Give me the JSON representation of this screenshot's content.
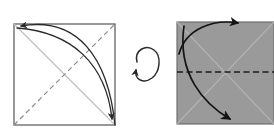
{
  "figure": {
    "type": "origami-fold-diagram",
    "title": "",
    "background_color": "#ffffff",
    "panels": [
      {
        "id": "panel-left",
        "name": "white-side-square",
        "label": "",
        "square": {
          "x": 14,
          "y": 24,
          "width": 101,
          "height": 101
        },
        "fill_color": "#ffffff",
        "border_color": "#555555",
        "border_width": 1.2,
        "creases": [
          {
            "name": "valley-crease-diagonal",
            "style": "dashed",
            "color": "#8a8a8a",
            "from": {
              "x": 14,
              "y": 125
            },
            "to": {
              "x": 115,
              "y": 24
            }
          },
          {
            "name": "existing-crease-diagonal",
            "style": "solid",
            "color": "#bdbdbd",
            "from": {
              "x": 14,
              "y": 24
            },
            "to": {
              "x": 115,
              "y": 125
            }
          }
        ],
        "arrows": [
          {
            "name": "fold-arrow-outer",
            "color": "#2b2b2b",
            "width": 1.3,
            "path": "M 115,125 C 108,58 78,16 18,26",
            "head_at": {
              "x": 18,
              "y": 26
            },
            "head_angle": -170
          },
          {
            "name": "fold-arrow-inner",
            "color": "#2b2b2b",
            "width": 1.3,
            "path": "M 17,28 C 72,30 106,62 113,122",
            "head_at": {
              "x": 113,
              "y": 124
            },
            "head_angle": 84
          }
        ]
      },
      {
        "id": "panel-right",
        "name": "colored-side-square",
        "label": "",
        "square": {
          "x": 177,
          "y": 22,
          "width": 97,
          "height": 102
        },
        "fill_color": "#9a9a9a",
        "border_color": "#6f6f6f",
        "border_width": 1.2,
        "creases": [
          {
            "name": "mountain-crease-horizontal",
            "style": "dashed",
            "color": "#1c1c1c",
            "from": {
              "x": 177,
              "y": 72
            },
            "to": {
              "x": 274,
              "y": 72
            }
          },
          {
            "name": "existing-crease-diagonal-down",
            "style": "solid",
            "color": "#b4b4b4",
            "from": {
              "x": 177,
              "y": 22
            },
            "to": {
              "x": 274,
              "y": 124
            }
          },
          {
            "name": "existing-crease-diagonal-up",
            "style": "solid",
            "color": "#b4b4b4",
            "from": {
              "x": 177,
              "y": 124
            },
            "to": {
              "x": 274,
              "y": 22
            }
          }
        ],
        "arrows": [
          {
            "name": "fold-arrow-upper",
            "color": "#141414",
            "width": 1.6,
            "path": "M 179,52 C 186,28 214,19 241,23",
            "head_at": {
              "x": 243,
              "y": 23
            },
            "head_angle": 8
          },
          {
            "name": "fold-arrow-lower",
            "color": "#141414",
            "width": 1.6,
            "path": "M 183,27 C 178,72 204,104 232,122",
            "head_at": {
              "x": 234,
              "y": 124
            },
            "head_angle": 56
          }
        ]
      }
    ],
    "turn_over_symbol": {
      "name": "turn-over-rotation-arrow",
      "label": "",
      "color": "#2b2b2b",
      "center": {
        "x": 148,
        "y": 68
      },
      "radius_x": 11,
      "radius_y": 13
    }
  }
}
